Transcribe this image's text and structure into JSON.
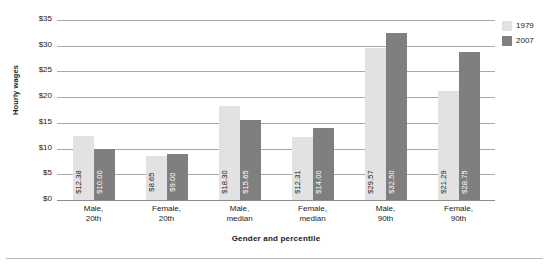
{
  "chart_data": {
    "type": "bar",
    "title": "",
    "xlabel": "Gender and percentile",
    "ylabel": "Hourly wages",
    "categories": [
      "Male, 20th",
      "Female, 20th",
      "Male, median",
      "Female, median",
      "Male, 90th",
      "Female, 90th"
    ],
    "category_lines": [
      [
        "Male,",
        "20th"
      ],
      [
        "Female,",
        "20th"
      ],
      [
        "Male,",
        "median"
      ],
      [
        "Female,",
        "median"
      ],
      [
        "Male,",
        "90th"
      ],
      [
        "Female,",
        "90th"
      ]
    ],
    "series": [
      {
        "name": "1979",
        "color": "#e2e2e2",
        "values": [
          12.38,
          8.65,
          18.3,
          12.31,
          29.57,
          21.29
        ],
        "labels": [
          "$12.38",
          "$8.65",
          "$18.30",
          "$12.31",
          "$29.57",
          "$21.29"
        ]
      },
      {
        "name": "2007",
        "color": "#7f7f7f",
        "values": [
          10.0,
          9.0,
          15.65,
          14.0,
          32.5,
          28.75
        ],
        "labels": [
          "$10.00",
          "$9.00",
          "$15.65",
          "$14.00",
          "$32.50",
          "$28.75"
        ]
      }
    ],
    "ylim": [
      0,
      35
    ],
    "ytick_values": [
      35,
      30,
      25,
      20,
      15,
      10,
      5,
      0
    ],
    "ytick_labels": [
      "$35",
      "$30",
      "$25",
      "$20",
      "$15",
      "$10",
      "$5",
      "$0"
    ],
    "grid": true,
    "legend_position": "right-top"
  },
  "legend": {
    "entries": [
      {
        "label": "1979"
      },
      {
        "label": "2007"
      }
    ]
  }
}
